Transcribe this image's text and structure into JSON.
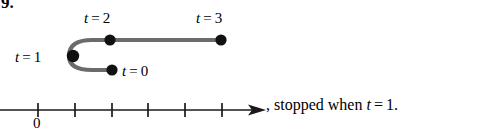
{
  "figure": {
    "problem_number": "9.",
    "curve": {
      "stroke_color": "#6b6b6b",
      "dot_color": "#111111",
      "points": [
        {
          "id": "t0",
          "label_var": "t",
          "label_eq": "=",
          "label_value": "0",
          "x": 112,
          "y": 70,
          "label_x": 122,
          "label_y": 64
        },
        {
          "id": "t1",
          "label_var": "t",
          "label_eq": "=",
          "label_value": "1",
          "x": 73,
          "y": 56,
          "label_x": 15,
          "label_y": 50
        },
        {
          "id": "t2",
          "label_var": "t",
          "label_eq": "=",
          "label_value": "2",
          "x": 110,
          "y": 40,
          "label_x": 84,
          "label_y": 11
        },
        {
          "id": "t3",
          "label_var": "t",
          "label_eq": "=",
          "label_value": "3",
          "x": 221,
          "y": 40,
          "label_x": 196,
          "label_y": 11
        }
      ],
      "path_d": "M 112 70 L 92 70 Q 69 70 69 56 Q 69 40 92 40 L 221 40"
    },
    "number_line": {
      "axis_color": "#1a1a1a",
      "y": 110,
      "x_start": 0,
      "x_end": 258,
      "arrow_tip_x": 266,
      "ticks": [
        38,
        75,
        112,
        148,
        185,
        222
      ],
      "tick_half_height": 7,
      "origin_label": "0",
      "origin_label_x": 33,
      "origin_label_y": 116
    },
    "trailing_sentence": {
      "comma": ",",
      "words": "stopped when",
      "var": "t",
      "eq": "=",
      "value": "1",
      "period": "."
    }
  }
}
